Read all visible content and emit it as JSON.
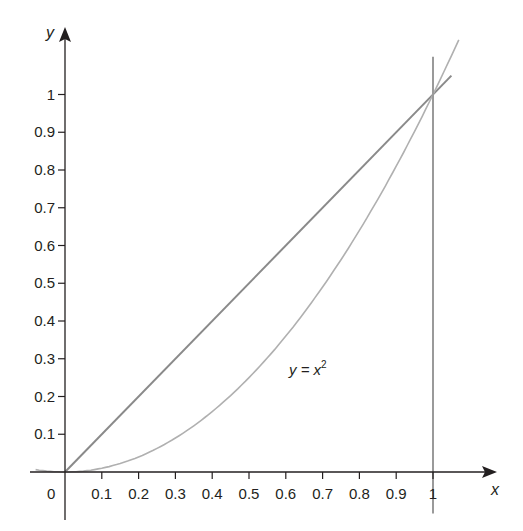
{
  "chart_data": {
    "type": "line",
    "title": "",
    "xlabel": "x",
    "ylabel": "y",
    "xlim": [
      -0.08,
      1.15
    ],
    "ylim": [
      -0.15,
      1.18
    ],
    "grid": false,
    "legend": null,
    "x_ticks": [
      "0.1",
      "0.2",
      "0.3",
      "0.4",
      "0.5",
      "0.6",
      "0.7",
      "0.8",
      "0.9",
      "1"
    ],
    "y_ticks": [
      "0.1",
      "0.2",
      "0.3",
      "0.4",
      "0.5",
      "0.6",
      "0.7",
      "0.8",
      "0.9",
      "1"
    ],
    "origin_label": "0",
    "series": [
      {
        "name": "y = x",
        "style": "straight line",
        "x": [
          0,
          1.05
        ],
        "y": [
          0,
          1.05
        ],
        "color": "#8a8a8a"
      },
      {
        "name": "y = x^2",
        "style": "curve",
        "x": [
          -0.08,
          0,
          0.2,
          0.4,
          0.6,
          0.8,
          1.0,
          1.07
        ],
        "y": [
          0.0064,
          0,
          0.04,
          0.16,
          0.36,
          0.64,
          1.0,
          1.1449
        ],
        "color": "#b0b0b0"
      },
      {
        "name": "x = 1",
        "style": "vertical line",
        "x": [
          1,
          1
        ],
        "y": [
          -0.11,
          1.1
        ],
        "color": "#9a9a9a"
      }
    ],
    "annotations": [
      {
        "text": "y = x",
        "superscript": "2",
        "x": 0.65,
        "y": 0.3
      }
    ]
  },
  "labels": {
    "x_axis": "x",
    "y_axis": "y",
    "origin": "0",
    "curve_label_base": "y = x",
    "curve_label_sup": "2"
  }
}
